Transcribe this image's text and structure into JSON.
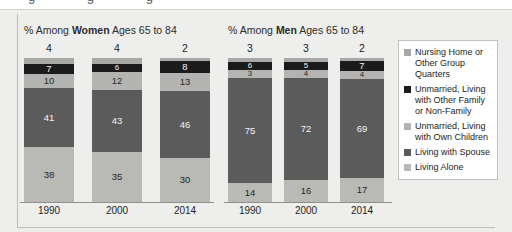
{
  "cutoff_text": "g      g      g",
  "chart_data": {
    "type": "bar",
    "subtype": "stacked-100-percent",
    "title": "",
    "grid": false,
    "legend_position": "right",
    "ylim": [
      0,
      100
    ],
    "ylabel": "",
    "xlabel": "",
    "value_unit": "%",
    "series_order": [
      "Nursing Home or Other Group Quarters",
      "Unmarried, Living with Other Family or Non-Family",
      "Unmarried, Living with Own Children",
      "Living with Spouse",
      "Living Alone"
    ],
    "panels": [
      {
        "id": "women",
        "title_prefix": "% Among ",
        "title_bold": "Women",
        "title_suffix": " Ages 65 to 84",
        "categories": [
          "1990",
          "2000",
          "2014"
        ],
        "series": [
          {
            "name": "Nursing Home or Other Group Quarters",
            "values": [
              4,
              4,
              2
            ]
          },
          {
            "name": "Unmarried, Living with Other Family or Non-Family",
            "values": [
              7,
              6,
              8
            ]
          },
          {
            "name": "Unmarried, Living with Own Children",
            "values": [
              10,
              12,
              13
            ]
          },
          {
            "name": "Living with Spouse",
            "values": [
              41,
              43,
              46
            ]
          },
          {
            "name": "Living Alone",
            "values": [
              38,
              35,
              30
            ]
          }
        ]
      },
      {
        "id": "men",
        "title_prefix": "% Among ",
        "title_bold": "Men",
        "title_suffix": " Ages 65 to 84",
        "categories": [
          "1990",
          "2000",
          "2014"
        ],
        "series": [
          {
            "name": "Nursing Home or Other Group Quarters",
            "values": [
              3,
              3,
              2
            ]
          },
          {
            "name": "Unmarried, Living with Other Family or Non-Family",
            "values": [
              6,
              5,
              7
            ]
          },
          {
            "name": "Unmarried, Living with Own Children",
            "values": [
              3,
              4,
              4
            ]
          },
          {
            "name": "Living with Spouse",
            "values": [
              75,
              72,
              69
            ]
          },
          {
            "name": "Living Alone",
            "values": [
              14,
              16,
              17
            ]
          }
        ]
      }
    ],
    "legend": [
      {
        "label": "Nursing Home or Other Group Quarters",
        "color": "#a8a8a6"
      },
      {
        "label": "Unmarried, Living with Other Family or Non-Family",
        "color": "#1b1b1b"
      },
      {
        "label": "Unmarried, Living with Own Children",
        "color": "#b3b3b1"
      },
      {
        "label": "Living with Spouse",
        "color": "#5b5b5b"
      },
      {
        "label": "Living Alone",
        "color": "#b9b9b6"
      }
    ],
    "colors": {
      "nursing_home": "#a8a8a6",
      "other_family": "#1b1b1b",
      "own_children": "#b3b3b1",
      "spouse": "#5b5b5b",
      "alone": "#b9b9b6",
      "panel_background": "#eeeeec",
      "legend_background": "#ffffff",
      "axis_line": "#8e8e8a"
    }
  }
}
